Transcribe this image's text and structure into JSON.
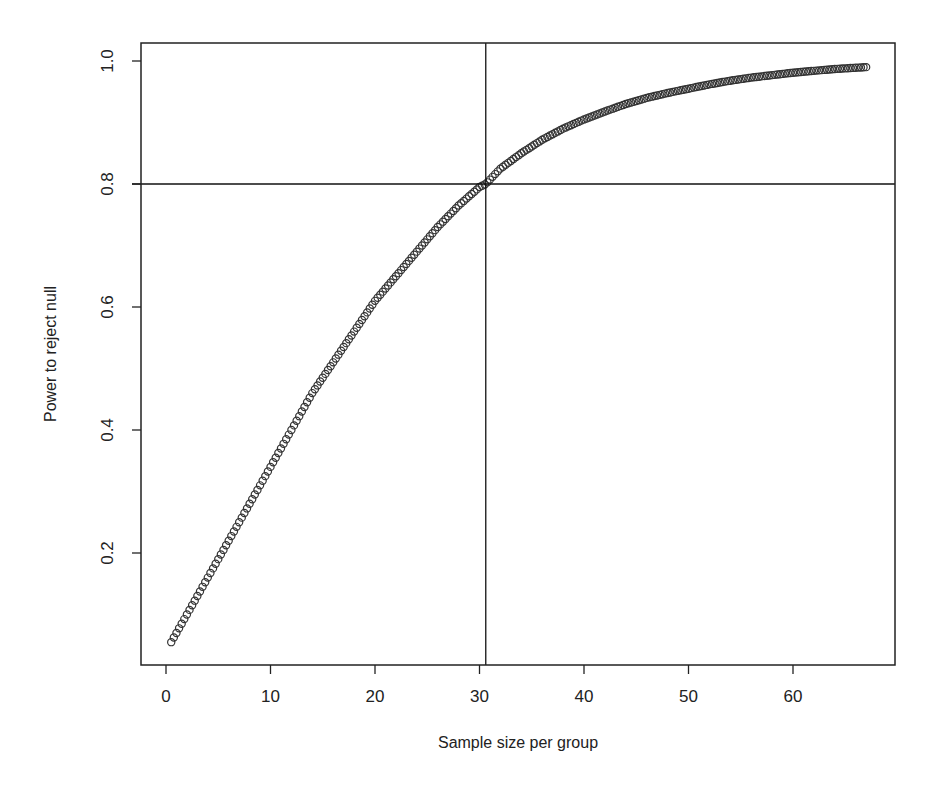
{
  "chart_data": {
    "type": "scatter",
    "title": "",
    "xlabel": "Sample size per group",
    "ylabel": "Power to reject null",
    "xlim": [
      -2.3,
      70
    ],
    "ylim": [
      0.02,
      1.03
    ],
    "x_ticks": [
      0,
      10,
      20,
      30,
      40,
      50,
      60
    ],
    "x_tick_labels": [
      "0",
      "10",
      "20",
      "30",
      "40",
      "50",
      "60"
    ],
    "y_ticks": [
      0.2,
      0.4,
      0.6,
      0.8,
      1.0
    ],
    "y_tick_labels": [
      "0.2",
      "0.4",
      "0.6",
      "0.8",
      "1.0"
    ],
    "grid": false,
    "legend": null,
    "marker": "open-circle",
    "marker_color": "#333333",
    "x_step": 0.25,
    "reference_lines": [
      {
        "orientation": "vertical",
        "x": 30.6,
        "color": "#111111"
      },
      {
        "orientation": "horizontal",
        "y": 0.8,
        "color": "#111111"
      }
    ],
    "x": [
      0.5,
      1,
      2,
      3,
      4,
      5,
      6,
      7,
      8,
      9,
      10,
      12,
      14,
      16,
      18,
      20,
      22,
      24,
      26,
      28,
      30,
      30.6,
      32,
      34,
      36,
      38,
      40,
      42,
      44,
      46,
      48,
      50,
      52,
      54,
      56,
      58,
      60,
      62,
      64,
      66,
      67
    ],
    "y": [
      0.055,
      0.07,
      0.1,
      0.13,
      0.16,
      0.19,
      0.22,
      0.25,
      0.28,
      0.31,
      0.34,
      0.4,
      0.46,
      0.51,
      0.56,
      0.61,
      0.65,
      0.69,
      0.73,
      0.765,
      0.795,
      0.8,
      0.825,
      0.85,
      0.872,
      0.89,
      0.905,
      0.918,
      0.93,
      0.94,
      0.948,
      0.955,
      0.962,
      0.968,
      0.973,
      0.977,
      0.981,
      0.984,
      0.987,
      0.989,
      0.99
    ]
  }
}
